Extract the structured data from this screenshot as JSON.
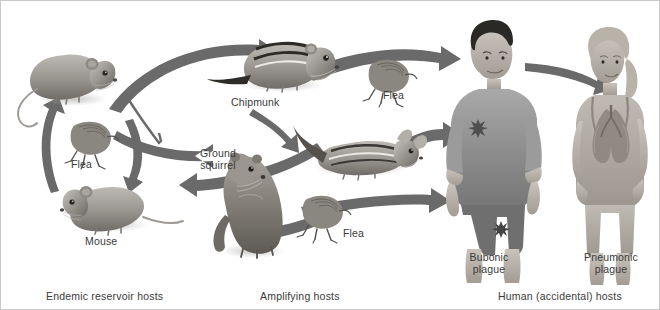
{
  "figure": {
    "background_color": "#ffffff",
    "arrow_color": "#6a6a6a",
    "text_color": "#3a3a3a",
    "width": 660,
    "height": 310
  },
  "groups": [
    {
      "id": "endemic",
      "caption": "Endemic reservoir hosts"
    },
    {
      "id": "amplifying",
      "caption": "Amplifying hosts"
    },
    {
      "id": "human",
      "caption": "Human (accidental) hosts"
    }
  ],
  "captions": {
    "endemic": "Endemic reservoir hosts",
    "amplifying": "Amplifying hosts",
    "human": "Human (accidental) hosts"
  },
  "labels": {
    "mouse": "Mouse",
    "flea_endemic": "Flea",
    "chipmunk": "Chipmunk",
    "ground_squirrel": "Ground squirrel",
    "flea_top": "Flea",
    "flea_bottom": "Flea",
    "bubonic": "Bubonic plague",
    "pneumonic": "Pneumonic plague"
  },
  "label_lines": {
    "ground_squirrel_line1": "Ground",
    "ground_squirrel_line2": "squirrel",
    "bubonic_line1": "Bubonic",
    "bubonic_line2": "plague",
    "pneumonic_line1": "Pneumonic",
    "pneumonic_line2": "plague"
  },
  "organisms": [
    {
      "id": "mouse-upper",
      "name": "Mouse",
      "group": "endemic"
    },
    {
      "id": "flea-endemic",
      "name": "Flea",
      "group": "endemic"
    },
    {
      "id": "mouse-lower",
      "name": "Mouse",
      "group": "endemic"
    },
    {
      "id": "chipmunk-upright",
      "name": "Chipmunk",
      "group": "amplifying"
    },
    {
      "id": "chipmunk-prone",
      "name": "Chipmunk",
      "group": "amplifying"
    },
    {
      "id": "ground-squirrel",
      "name": "Ground squirrel",
      "group": "amplifying"
    },
    {
      "id": "flea-top",
      "name": "Flea",
      "group": "amplifying"
    },
    {
      "id": "flea-bottom",
      "name": "Flea",
      "group": "amplifying"
    },
    {
      "id": "man-bubonic",
      "name": "Man with bubonic plague",
      "group": "human"
    },
    {
      "id": "woman-pneumonic",
      "name": "Woman with pneumonic plague",
      "group": "human"
    }
  ],
  "transmission_arrows": [
    {
      "from": "mouse-upper",
      "to": "chipmunk-upright"
    },
    {
      "from": "chipmunk-prone",
      "to": "flea-endemic"
    },
    {
      "from": "mouse-upper",
      "to": "flea-endemic"
    },
    {
      "from": "flea-endemic",
      "to": "mouse-lower"
    },
    {
      "from": "mouse-lower",
      "to": "mouse-upper"
    },
    {
      "from": "chipmunk-upright",
      "to": "chipmunk-prone"
    },
    {
      "from": "ground-squirrel",
      "to": "chipmunk-prone"
    },
    {
      "from": "flea-bottom",
      "to": "ground-squirrel"
    },
    {
      "from": "flea-top",
      "to": "man-bubonic"
    },
    {
      "from": "chipmunk-prone",
      "to": "man-bubonic"
    },
    {
      "from": "flea-bottom",
      "to": "man-bubonic"
    },
    {
      "from": "man-bubonic",
      "to": "woman-pneumonic"
    }
  ]
}
